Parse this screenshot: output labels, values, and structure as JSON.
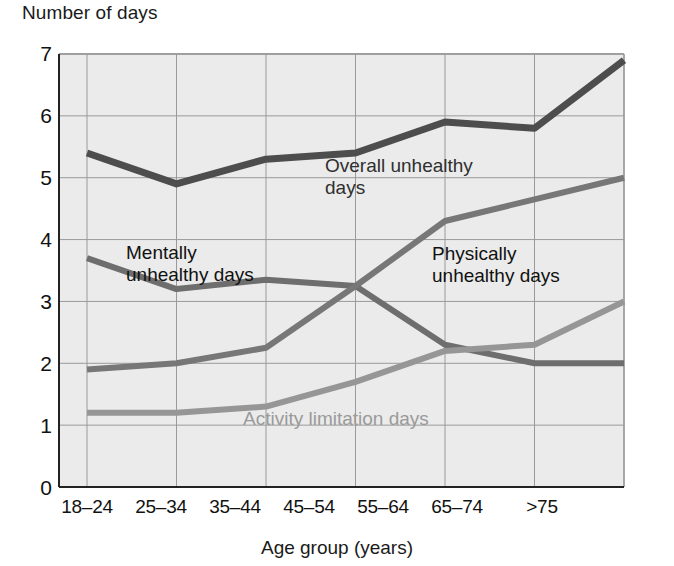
{
  "chart_data": {
    "type": "line",
    "title": "",
    "xlabel": "Age group (years)",
    "ylabel": "Number of days",
    "categories": [
      "18–24",
      "25–34",
      "35–44",
      "45–54",
      "55–64",
      "65–74",
      ">75"
    ],
    "yticks": [
      "0",
      "1",
      "2",
      "3",
      "4",
      "5",
      "6",
      "7"
    ],
    "ylim": [
      0,
      7
    ],
    "grid": true,
    "legend_position": "inline-annotations",
    "series": [
      {
        "name": "Overall unhealthy days",
        "color": "#4d4d4d",
        "values": [
          5.4,
          4.9,
          5.3,
          5.4,
          5.9,
          5.8,
          6.9
        ]
      },
      {
        "name": "Mentally unhealthy days",
        "color": "#6e6e6e",
        "values": [
          3.7,
          3.2,
          3.35,
          3.25,
          2.3,
          2.0,
          2.0
        ]
      },
      {
        "name": "Physically unhealthy days",
        "color": "#777777",
        "values": [
          1.9,
          2.0,
          2.25,
          3.25,
          4.3,
          4.65,
          5.0
        ]
      },
      {
        "name": "Activity limitation days",
        "color": "#969696",
        "values": [
          1.2,
          1.2,
          1.3,
          1.7,
          2.2,
          2.3,
          3.0
        ]
      }
    ],
    "annotations": [
      {
        "name": "overall-label",
        "text": "Overall unhealthy\ndays",
        "color": "#2f2f2f"
      },
      {
        "name": "mentally-label",
        "text": "Mentally\nunhealthy days",
        "color": "#111111"
      },
      {
        "name": "physically-label",
        "text": "Physically\nunhealthy days",
        "color": "#111111"
      },
      {
        "name": "activity-label",
        "text": "Activity limitation days",
        "color": "#9a9a9a"
      }
    ]
  },
  "axes": {
    "y_title": "Number of days",
    "x_title": "Age group (years)"
  }
}
